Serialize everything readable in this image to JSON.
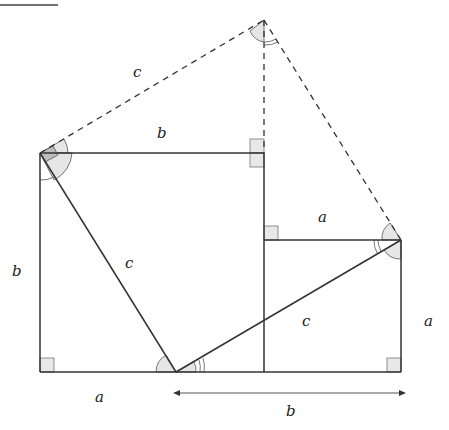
{
  "diagram": {
    "colors": {
      "line": "#333333",
      "angle_fill": "#e6e6e6",
      "right_angle_fill": "#e8e8e8",
      "dark_fill": "#bdbdbd"
    },
    "labels": {
      "top_left_c": "c",
      "top_b": "b",
      "left_b": "b",
      "inner_c_left": "c",
      "small_top_a": "a",
      "inner_c_right": "c",
      "right_a": "a",
      "bottom_a": "a",
      "bottom_b": "b"
    }
  }
}
